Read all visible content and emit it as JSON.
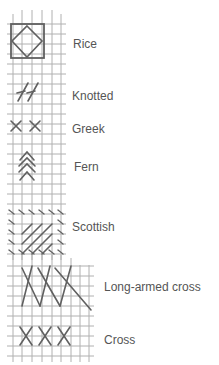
{
  "colors": {
    "grid": "#a8a8a8",
    "stitch": "#606060",
    "text": "#555555",
    "background": "#ffffff"
  },
  "stitches": [
    {
      "id": "rice",
      "label": "Rice",
      "label_x": 73,
      "label_y": 37
    },
    {
      "id": "knotted",
      "label": "Knotted",
      "label_x": 72,
      "label_y": 89
    },
    {
      "id": "greek",
      "label": "Greek",
      "label_x": 72,
      "label_y": 122
    },
    {
      "id": "fern",
      "label": "Fern",
      "label_x": 74,
      "label_y": 160
    },
    {
      "id": "scottish",
      "label": "Scottish",
      "label_x": 72,
      "label_y": 220
    },
    {
      "id": "long-armed-cross",
      "label": "Long-armed cross",
      "label_x": 104,
      "label_y": 280
    },
    {
      "id": "cross",
      "label": "Cross",
      "label_x": 104,
      "label_y": 333
    }
  ]
}
